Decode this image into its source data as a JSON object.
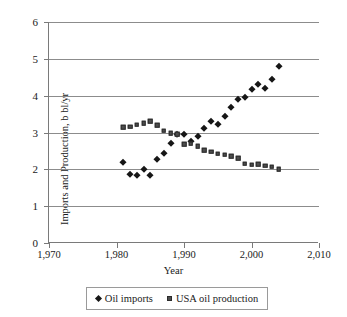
{
  "chart_data": {
    "type": "scatter",
    "title": "",
    "xlabel": "Year",
    "ylabel": "Imports and Production, b bl/yr",
    "xlim": [
      1970,
      2010
    ],
    "ylim": [
      0,
      6
    ],
    "xticks": [
      "1,970",
      "1,980",
      "1,990",
      "2,000",
      "2,010"
    ],
    "xtick_values": [
      1970,
      1980,
      1990,
      2000,
      2010
    ],
    "yticks": [
      "0",
      "1",
      "2",
      "3",
      "4",
      "5",
      "6"
    ],
    "ytick_values": [
      0,
      1,
      2,
      3,
      4,
      5,
      6
    ],
    "grid": true,
    "legend_position": "bottom",
    "series": [
      {
        "name": "Oil imports",
        "marker": "diamond",
        "color": "#161616",
        "x": [
          1981,
          1982,
          1983,
          1984,
          1985,
          1986,
          1987,
          1988,
          1989,
          1990,
          1991,
          1992,
          1993,
          1994,
          1995,
          1996,
          1997,
          1998,
          1999,
          2000,
          2001,
          2002,
          2003,
          2004
        ],
        "values": [
          2.2,
          1.87,
          1.85,
          2.0,
          1.85,
          2.28,
          2.45,
          2.72,
          2.95,
          2.96,
          2.78,
          2.9,
          3.12,
          3.3,
          3.24,
          3.46,
          3.7,
          3.9,
          3.96,
          4.18,
          4.33,
          4.2,
          4.45,
          4.8
        ]
      },
      {
        "name": "USA oil production",
        "marker": "square",
        "color": "#4d4d4d",
        "x": [
          1981,
          1982,
          1983,
          1984,
          1985,
          1986,
          1987,
          1988,
          1989,
          1990,
          1991,
          1992,
          1993,
          1994,
          1995,
          1996,
          1997,
          1998,
          1999,
          2000,
          2001,
          2002,
          2003,
          2004
        ],
        "values": [
          3.15,
          3.16,
          3.21,
          3.25,
          3.3,
          3.2,
          3.05,
          2.98,
          2.95,
          2.68,
          2.7,
          2.62,
          2.52,
          2.48,
          2.42,
          2.4,
          2.35,
          2.3,
          2.15,
          2.13,
          2.14,
          2.1,
          2.07,
          2.0
        ]
      }
    ]
  },
  "legend": {
    "items": [
      {
        "label": "Oil imports"
      },
      {
        "label": "USA oil production"
      }
    ]
  }
}
